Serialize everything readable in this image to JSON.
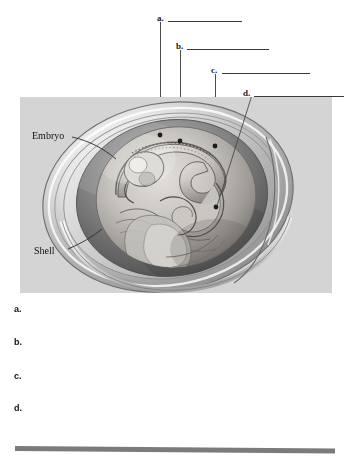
{
  "figure": {
    "illustration_labels": [
      {
        "id": "embryo",
        "text": "Embryo"
      },
      {
        "id": "shell",
        "text": "Shell"
      }
    ],
    "callouts": [
      {
        "id": "a",
        "text": "a."
      },
      {
        "id": "b",
        "text": "b."
      },
      {
        "id": "c",
        "text": "c."
      },
      {
        "id": "d",
        "text": "d."
      }
    ]
  },
  "answers": {
    "items": [
      {
        "id": "a",
        "label": "a.",
        "value": ""
      },
      {
        "id": "b",
        "label": "b.",
        "value": ""
      },
      {
        "id": "c",
        "label": "c.",
        "value": ""
      },
      {
        "id": "d",
        "label": "d.",
        "value": ""
      }
    ]
  },
  "colors": {
    "panel_background": "#d4d4d4",
    "rule": "#3a3a3a",
    "leader": "#4a4a4a",
    "bottom_bar": "#7b7b7b",
    "text": "#111111"
  }
}
